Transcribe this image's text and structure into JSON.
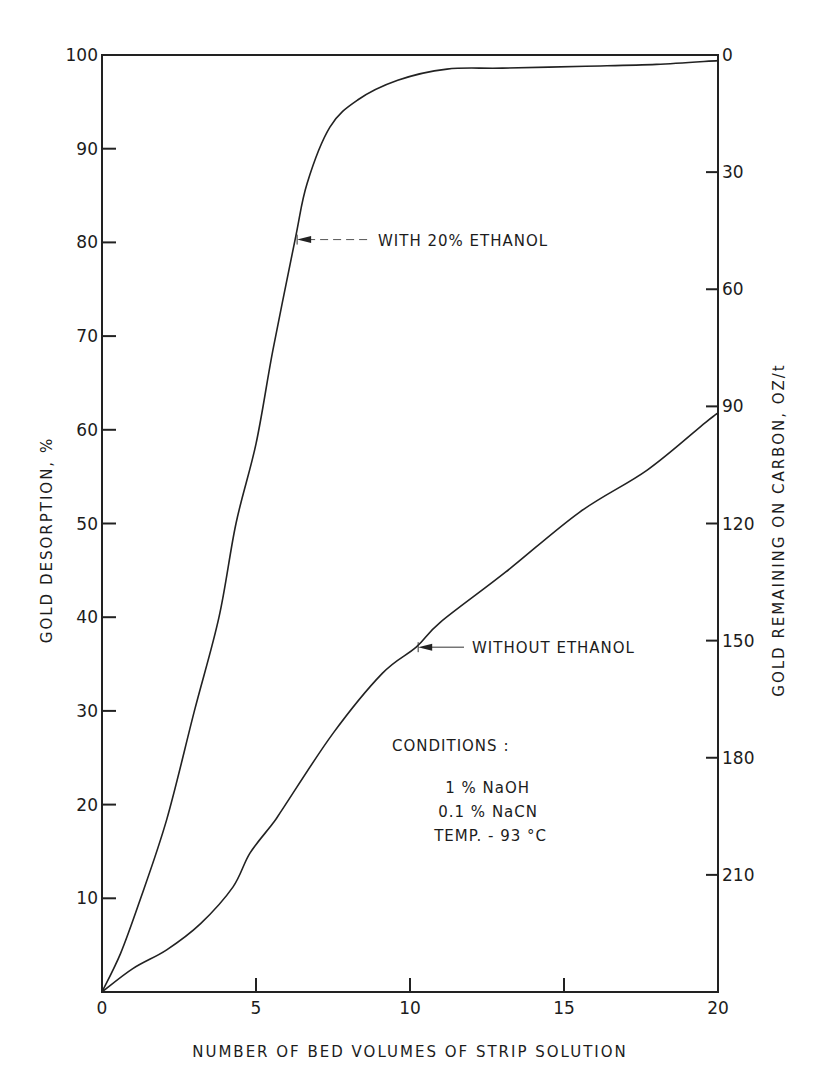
{
  "chart_data": {
    "type": "line",
    "title": "",
    "xlabel": "NUMBER OF BED VOLUMES OF STRIP SOLUTION",
    "ylabel": "GOLD DESORPTION, %",
    "y2label": "GOLD REMAINING ON CARBON, OZ/t",
    "xlim": [
      0,
      20
    ],
    "ylim": [
      0,
      100
    ],
    "y2lim": [
      240,
      0
    ],
    "grid": false,
    "x_ticks": [
      0,
      5,
      10,
      15,
      20
    ],
    "x_tick_labels": [
      "0",
      "5",
      "10",
      "15",
      "20"
    ],
    "y_ticks": [
      10,
      20,
      30,
      40,
      50,
      60,
      70,
      80,
      90,
      100
    ],
    "y_tick_labels": [
      "10",
      "20",
      "30",
      "40",
      "50",
      "60",
      "70",
      "80",
      "90",
      "100"
    ],
    "y2_ticks": [
      0,
      30,
      60,
      90,
      120,
      150,
      180,
      210
    ],
    "y2_tick_labels": [
      "0",
      "30",
      "60",
      "90",
      "120",
      "150",
      "180",
      "210"
    ],
    "series": [
      {
        "name": "WITH 20% ETHANOL",
        "x": [
          0,
          0.6,
          1.2,
          2.1,
          3.0,
          3.8,
          4.35,
          5.0,
          5.55,
          6.27,
          6.66,
          7.4,
          8.3,
          9.6,
          11.2,
          13.0,
          15.7,
          18.0,
          20.0
        ],
        "y": [
          0,
          4.1,
          9.5,
          18.4,
          30.0,
          40.0,
          50.0,
          58.5,
          68.5,
          80.3,
          86.3,
          92.3,
          95.2,
          97.3,
          98.5,
          98.6,
          98.8,
          99.0,
          99.4
        ]
      },
      {
        "name": "WITHOUT ETHANOL",
        "x": [
          0,
          1.0,
          2.1,
          3.2,
          4.25,
          4.8,
          5.55,
          5.9,
          7.5,
          9.1,
          10.2,
          11.0,
          13.1,
          15.5,
          17.7,
          19.6,
          20.0
        ],
        "y": [
          0,
          2.5,
          4.5,
          7.3,
          11.2,
          14.8,
          18.0,
          19.7,
          27.6,
          34.0,
          36.8,
          39.5,
          44.8,
          51.2,
          55.7,
          60.8,
          61.8
        ]
      }
    ],
    "annotations": [
      {
        "text": "WITH 20% ETHANOL",
        "points_to": {
          "x": 6.27,
          "y": 80.3
        }
      },
      {
        "text": "WITHOUT ETHANOL",
        "points_to": {
          "x": 10.2,
          "y": 36.8
        }
      }
    ],
    "conditions": {
      "heading": "CONDITIONS :",
      "lines": [
        "1 % NaOH",
        "0.1 % NaCN",
        "TEMP. - 93 °C"
      ]
    }
  }
}
